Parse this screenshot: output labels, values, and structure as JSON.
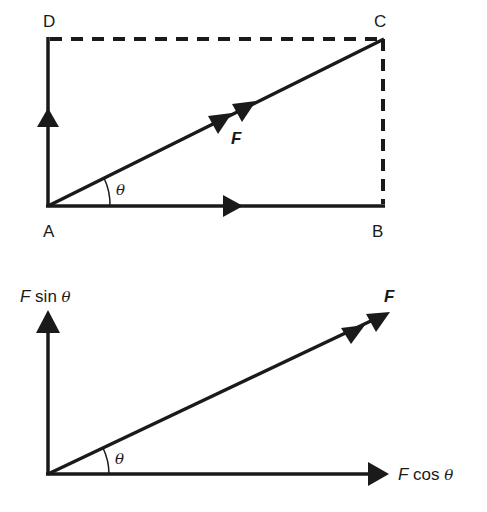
{
  "diagram": {
    "colors": {
      "ink": "#1a1a1a",
      "background": "#ffffff"
    },
    "top": {
      "points": {
        "A": "A",
        "B": "B",
        "C": "C",
        "D": "D"
      },
      "force_label": "F",
      "angle_label": "θ",
      "edges": [
        {
          "from": "A",
          "to": "B",
          "style": "solid",
          "arrow": "single"
        },
        {
          "from": "A",
          "to": "D",
          "style": "solid",
          "arrow": "single"
        },
        {
          "from": "A",
          "to": "C",
          "style": "solid",
          "arrow": "double"
        },
        {
          "from": "D",
          "to": "C",
          "style": "dashed",
          "arrow": "none"
        },
        {
          "from": "C",
          "to": "B",
          "style": "dashed",
          "arrow": "none"
        }
      ]
    },
    "bottom": {
      "force_label": "F",
      "angle_label": "θ",
      "vertical_component": {
        "prefix": "F",
        "func": " sin ",
        "angle": "θ"
      },
      "horizontal_component": {
        "prefix": "F",
        "func": " cos ",
        "angle": "θ"
      }
    }
  }
}
